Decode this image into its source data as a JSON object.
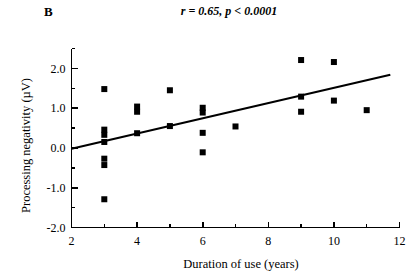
{
  "figure": {
    "panel_label": "B",
    "background_color": "#ffffff",
    "ink_color": "#000000"
  },
  "chart_data": {
    "type": "scatter",
    "title": "r = 0.65, p < 0.0001",
    "panel_label": "B",
    "xlabel": "Duration of use (years)",
    "ylabel": "Processing negativity  (µV)",
    "xlim": [
      2,
      12
    ],
    "ylim": [
      -2.0,
      2.5
    ],
    "grid": false,
    "legend": "none",
    "xticks": [
      2,
      4,
      6,
      8,
      10,
      12
    ],
    "xtick_labels": [
      "2",
      "4",
      "6",
      "8",
      "10",
      "12"
    ],
    "xminor_ticks": [
      3,
      5,
      7,
      9,
      11
    ],
    "yticks": [
      2.0,
      1.0,
      0.0,
      -1.0,
      -2.0
    ],
    "ytick_labels": [
      "2.0",
      "1.0",
      "0.0",
      "-1.0",
      "-2.0"
    ],
    "yminor_ticks": [
      2.5,
      1.5,
      0.5,
      -0.5,
      -1.5
    ],
    "statistics": {
      "r_label": "r",
      "r_value": "0.65",
      "p_label": "p",
      "p_value": "< 0.0001"
    },
    "marker": {
      "shape": "square",
      "color": "#000000",
      "size_px": 6
    },
    "fit_line": {
      "label": "linear regression",
      "color": "#000000",
      "width_px": 2.1,
      "x_start": 2.0,
      "y_start": -0.02,
      "x_end": 11.72,
      "y_end": 1.84
    },
    "points": [
      {
        "x": 3,
        "y": 1.48
      },
      {
        "x": 3,
        "y": 0.46
      },
      {
        "x": 3,
        "y": 0.33
      },
      {
        "x": 3,
        "y": 0.15
      },
      {
        "x": 3,
        "y": -0.27
      },
      {
        "x": 3,
        "y": -0.43
      },
      {
        "x": 3,
        "y": -1.29
      },
      {
        "x": 4,
        "y": 1.04
      },
      {
        "x": 4,
        "y": 0.91
      },
      {
        "x": 4,
        "y": 0.37
      },
      {
        "x": 5,
        "y": 1.45
      },
      {
        "x": 5,
        "y": 0.55
      },
      {
        "x": 6,
        "y": 1.01
      },
      {
        "x": 6,
        "y": 0.89
      },
      {
        "x": 6,
        "y": 0.38
      },
      {
        "x": 6,
        "y": -0.11
      },
      {
        "x": 7,
        "y": 0.54
      },
      {
        "x": 9,
        "y": 2.21
      },
      {
        "x": 9,
        "y": 1.29
      },
      {
        "x": 9,
        "y": 0.91
      },
      {
        "x": 10,
        "y": 2.16
      },
      {
        "x": 10,
        "y": 1.19
      },
      {
        "x": 11,
        "y": 0.95
      }
    ]
  }
}
